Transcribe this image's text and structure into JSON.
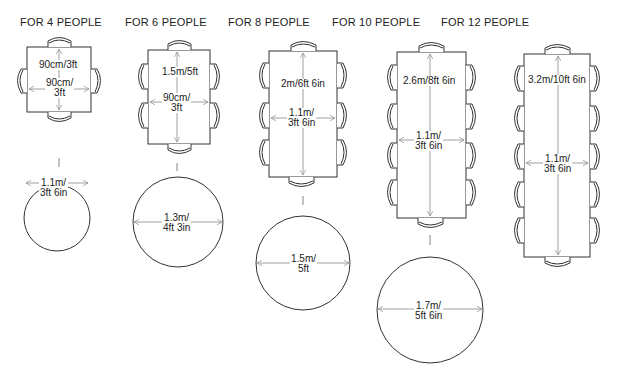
{
  "groups": [
    {
      "title": "FOR 4 PEOPLE",
      "table": {
        "shape": "square",
        "length": "90cm/3ft",
        "width_line1": "90cm/",
        "width_line2": "3ft"
      },
      "chairs": {
        "top": 1,
        "bottom": 1,
        "left": 1,
        "right": 1
      },
      "round_table": {
        "diameter_line1": "1.1m/",
        "diameter_line2": "3ft 6in"
      }
    },
    {
      "title": "FOR 6 PEOPLE",
      "table": {
        "shape": "rectangle",
        "length": "1.5m/5ft",
        "width_line1": "90cm/",
        "width_line2": "3ft"
      },
      "chairs": {
        "top": 1,
        "bottom": 1,
        "left": 2,
        "right": 2
      },
      "round_table": {
        "diameter_line1": "1.3m/",
        "diameter_line2": "4ft 3in"
      }
    },
    {
      "title": "FOR 8 PEOPLE",
      "table": {
        "shape": "rectangle",
        "length": "2m/6ft 6in",
        "width_line1": "1.1m/",
        "width_line2": "3ft 6in"
      },
      "chairs": {
        "top": 1,
        "bottom": 1,
        "left": 3,
        "right": 3
      },
      "round_table": {
        "diameter_line1": "1.5m/",
        "diameter_line2": "5ft"
      }
    },
    {
      "title": "FOR 10 PEOPLE",
      "table": {
        "shape": "rectangle",
        "length": "2.6m/8ft 6in",
        "width_line1": "1.1m/",
        "width_line2": "3ft 6in"
      },
      "chairs": {
        "top": 1,
        "bottom": 1,
        "left": 4,
        "right": 4
      },
      "round_table": {
        "diameter_line1": "1.7m/",
        "diameter_line2": "5ft 6in"
      }
    },
    {
      "title": "FOR 12 PEOPLE",
      "table": {
        "shape": "rectangle",
        "length": "3.2m/10ft 6in",
        "width_line1": "1.1m/",
        "width_line2": "3ft 6in"
      },
      "chairs": {
        "top": 1,
        "bottom": 1,
        "left": 5,
        "right": 5
      },
      "round_table": null
    }
  ],
  "colors": {
    "line": "#333333",
    "arrow": "#888888",
    "background": "#ffffff"
  }
}
